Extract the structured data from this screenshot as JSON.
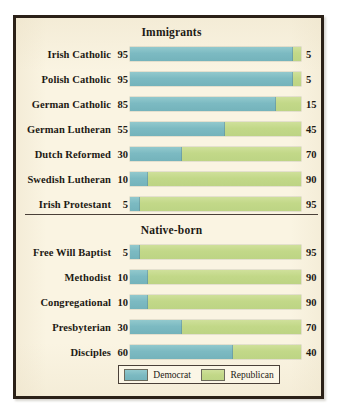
{
  "figure": {
    "title_immigrants": "Immigrants",
    "title_native": "Native-born",
    "background_color": "#faf4e2",
    "frame_color": "#2b2118"
  },
  "legend": {
    "democrat_label": "Democrat",
    "republican_label": "Republican",
    "democrat_color": "#7cbac2",
    "republican_color": "#c2d888"
  },
  "chart_data": {
    "type": "bar",
    "title": "",
    "xlabel": "",
    "ylabel": "",
    "xlim": [
      0,
      100
    ],
    "grid": false,
    "orientation": "horizontal",
    "stacked": true,
    "percent": true,
    "legend_position": "bottom-center",
    "series": [
      {
        "name": "Democrat",
        "color": "#7cbac2"
      },
      {
        "name": "Republican",
        "color": "#c2d888"
      }
    ],
    "groups": [
      {
        "name": "Immigrants",
        "categories": [
          "Irish Catholic",
          "Polish Catholic",
          "German Catholic",
          "German Lutheran",
          "Dutch Reformed",
          "Swedish Lutheran",
          "Irish Protestant"
        ],
        "democrat": [
          95,
          95,
          85,
          55,
          30,
          10,
          5
        ],
        "republican": [
          5,
          5,
          15,
          45,
          70,
          90,
          95
        ]
      },
      {
        "name": "Native-born",
        "categories": [
          "Free Will Baptist",
          "Methodist",
          "Congregational",
          "Presbyterian",
          "Disciples"
        ],
        "democrat": [
          5,
          10,
          10,
          30,
          60
        ],
        "republican": [
          95,
          90,
          90,
          70,
          40
        ]
      }
    ]
  }
}
